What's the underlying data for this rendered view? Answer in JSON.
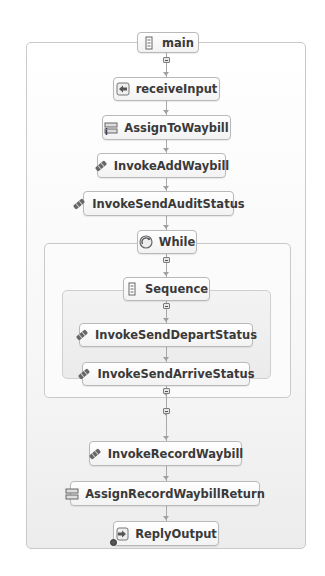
{
  "diagram": {
    "type": "bpel-process-flow",
    "process": {
      "label": "main",
      "icon": "sequence-icon"
    },
    "activities_before_loop": [
      {
        "id": "receiveInput",
        "label": "receiveInput",
        "icon": "receive-icon"
      },
      {
        "id": "AssignToWaybill",
        "label": "AssignToWaybill",
        "icon": "assign-icon"
      },
      {
        "id": "InvokeAddWaybill",
        "label": "InvokeAddWaybill",
        "icon": "invoke-icon"
      },
      {
        "id": "InvokeSendAuditStatus",
        "label": "InvokeSendAuditStatus",
        "icon": "invoke-icon"
      }
    ],
    "loop": {
      "label": "While",
      "icon": "while-icon",
      "sequence": {
        "label": "Sequence",
        "icon": "sequence-icon",
        "activities": [
          {
            "id": "InvokeSendDepartStatus",
            "label": "InvokeSendDepartStatus",
            "icon": "invoke-icon"
          },
          {
            "id": "InvokeSendArriveStatus",
            "label": "InvokeSendArriveStatus",
            "icon": "invoke-icon"
          }
        ]
      }
    },
    "activities_after_loop": [
      {
        "id": "InvokeRecordWaybill",
        "label": "InvokeRecordWaybill",
        "icon": "invoke-icon"
      },
      {
        "id": "AssignRecordWaybillReturn",
        "label": "AssignRecordWaybillReturn",
        "icon": "assign-icon"
      },
      {
        "id": "ReplyOutput",
        "label": "ReplyOutput",
        "icon": "reply-icon"
      }
    ],
    "markers": {
      "assign_corner_mark": "i"
    },
    "colors": {
      "node_border": "#b9b9b9",
      "container_border": "#c9c9c9",
      "text": "#3a3a3a",
      "connector": "#a8a8a8"
    }
  }
}
